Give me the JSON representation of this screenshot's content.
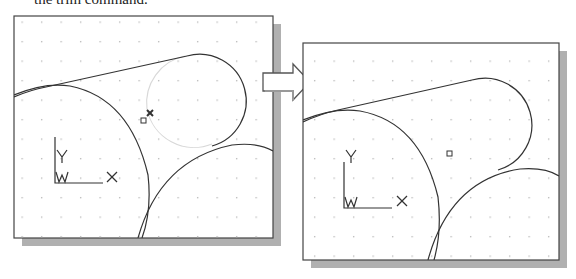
{
  "caption": "the trim command.",
  "panels": [
    {
      "name": "before",
      "ucs": {
        "y_label": "Y",
        "x_label": "X",
        "w_label": "W"
      }
    },
    {
      "name": "after",
      "ucs": {
        "y_label": "Y",
        "x_label": "X",
        "w_label": "W"
      }
    }
  ],
  "arrow": {
    "direction": "right",
    "meaning": "before-to-after"
  },
  "colors": {
    "line": "#333333",
    "grid_dot": "#b5b5b5",
    "shadow": "#b0b0b0",
    "trimmed_arc": "#d8d8d8"
  }
}
